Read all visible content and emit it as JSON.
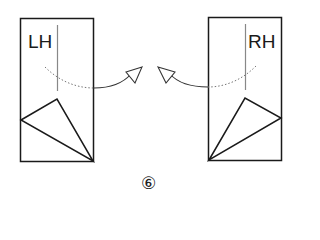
{
  "diagram": {
    "step_number": "⑥",
    "left_panel": {
      "label": "LH",
      "rect": {
        "x": 20,
        "y": 18,
        "w": 73,
        "h": 143
      },
      "center_line": {
        "x": 57,
        "y1": 25,
        "y2": 90
      },
      "triangle": [
        [
          21,
          120
        ],
        [
          57,
          99
        ],
        [
          93,
          161
        ]
      ],
      "arrow_direction": "right"
    },
    "right_panel": {
      "label": "RH",
      "rect": {
        "x": 208,
        "y": 17,
        "w": 73,
        "h": 143
      },
      "center_line": {
        "x": 245,
        "y1": 24,
        "y2": 89
      },
      "triangle": [
        [
          209,
          160
        ],
        [
          245,
          98
        ],
        [
          281,
          118
        ]
      ],
      "arrow_direction": "left"
    },
    "colors": {
      "stroke": "#1a1a1a",
      "guide": "#888888",
      "background": "#ffffff"
    }
  }
}
